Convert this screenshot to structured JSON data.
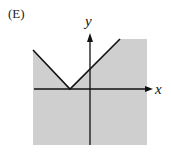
{
  "option_label": "(E)",
  "axes": {
    "x_label": "x",
    "y_label": "y"
  },
  "colors": {
    "shade": "#cfcfcf",
    "line": "#111111"
  },
  "graph": {
    "description": "Absolute-value V shaped boundary with vertex on negative x-axis; region below/outside the V is shaded",
    "shaded_region": "below the V boundary"
  }
}
